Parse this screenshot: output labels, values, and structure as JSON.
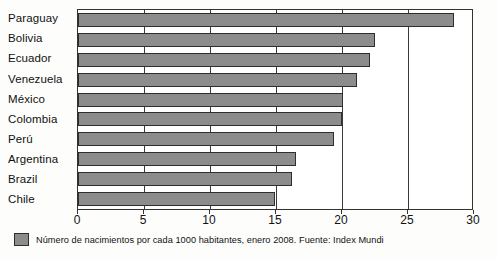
{
  "chart_data": {
    "type": "bar",
    "orientation": "horizontal",
    "title": "",
    "subtitle": "",
    "xlabel": "",
    "ylabel": "",
    "categories": [
      "Paraguay",
      "Bolivia",
      "Ecuador",
      "Venezuela",
      "México",
      "Colombia",
      "Perú",
      "Argentina",
      "Brazil",
      "Chile"
    ],
    "values": [
      28.5,
      22.5,
      22.1,
      21.1,
      20.1,
      20.0,
      19.4,
      16.5,
      16.2,
      14.9
    ],
    "series": [
      {
        "name": "Número de nacimientos por cada 1000 habitantes",
        "values": [
          28.5,
          22.5,
          22.1,
          21.1,
          20.1,
          20.0,
          19.4,
          16.5,
          16.2,
          14.9
        ]
      }
    ],
    "xlim": [
      0,
      30
    ],
    "xticks": [
      0,
      5,
      10,
      15,
      20,
      25,
      30
    ],
    "xtick_labels": [
      "0",
      "5",
      "10",
      "15",
      "20",
      "25",
      "30"
    ],
    "grid": true,
    "grid_axis": "x",
    "legend_position": "below-left",
    "bar_color": "#8c8c8c",
    "bar_edge_color": "#2e2e2e",
    "frame_color": "#333333",
    "background_color": "#ffffff"
  },
  "legend": {
    "entries": [
      {
        "swatch_color": "#8c8c8c",
        "label": "Número de nacimientos por cada 1000 habitantes, enero 2008. Fuente: Index Mundi"
      }
    ]
  }
}
